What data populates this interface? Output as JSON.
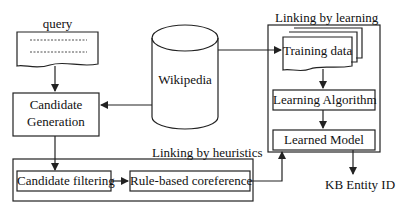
{
  "diagram": {
    "query": {
      "label": "query"
    },
    "wikipedia": {
      "label": "Wikipedia"
    },
    "candidate_generation": {
      "line1": "Candidate",
      "line2": "Generation"
    },
    "learning_group": {
      "title": "Linking by learning",
      "training_data": "Training data",
      "learning_algorithm": "Learning Algorithm",
      "learned_model": "Learned Model"
    },
    "heuristics_group": {
      "title": "Linking by heuristics",
      "candidate_filtering": "Candidate filtering",
      "rule_based_coreference": "Rule-based coreference"
    },
    "output": {
      "label": "KB Entity ID"
    }
  },
  "colors": {
    "stroke": "#222222",
    "background": "#ffffff"
  }
}
